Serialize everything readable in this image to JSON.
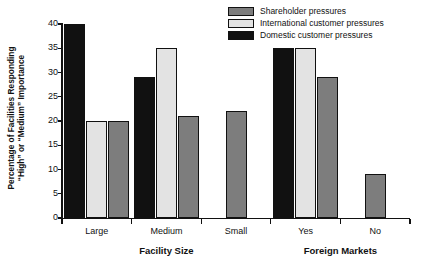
{
  "chart_data": {
    "type": "bar",
    "title": "",
    "xlabel": "",
    "ylabel": "Percentage of Facilities Responding \"High\" or \"Medium\" Importance",
    "ylabel_line1": "Percentage of Facilities Responding",
    "ylabel_line2": "“High” or “Medium” Importance",
    "ylim": [
      0,
      40
    ],
    "ytick_labels": [
      "40",
      "35",
      "30",
      "25",
      "20",
      "15",
      "10",
      "5",
      "0"
    ],
    "ytick_values": [
      40,
      35,
      30,
      25,
      20,
      15,
      10,
      5,
      0
    ],
    "grid": false,
    "legend_position": "top-right",
    "categories": [
      "Large",
      "Medium",
      "Small",
      "Yes",
      "No"
    ],
    "group_axis_titles": [
      {
        "label": "Facility Size",
        "categories": [
          "Large",
          "Medium",
          "Small"
        ]
      },
      {
        "label": "Foreign Markets",
        "categories": [
          "Yes",
          "No"
        ]
      }
    ],
    "series": [
      {
        "name": "Domestic customer pressures",
        "color": "#111111",
        "values": [
          40,
          29,
          null,
          35,
          null
        ]
      },
      {
        "name": "International customer pressures",
        "color": "#e3e3e3",
        "values": [
          20,
          35,
          null,
          35,
          null
        ]
      },
      {
        "name": "Shareholder pressures",
        "color": "#7d7d7d",
        "values": [
          20,
          21,
          22,
          29,
          9
        ]
      }
    ],
    "legend_entries": [
      {
        "label": "Shareholder pressures",
        "color": "#7d7d7d"
      },
      {
        "label": "International customer pressures",
        "color": "#e3e3e3"
      },
      {
        "label": "Domestic customer pressures",
        "color": "#111111"
      }
    ],
    "bars": [
      {
        "category": "Large",
        "series": "Domestic customer pressures",
        "value": 40
      },
      {
        "category": "Large",
        "series": "International customer pressures",
        "value": 20
      },
      {
        "category": "Large",
        "series": "Shareholder pressures",
        "value": 20
      },
      {
        "category": "Medium",
        "series": "Domestic customer pressures",
        "value": 29
      },
      {
        "category": "Medium",
        "series": "International customer pressures",
        "value": 35
      },
      {
        "category": "Medium",
        "series": "Shareholder pressures",
        "value": 21
      },
      {
        "category": "Small",
        "series": "Shareholder pressures",
        "value": 22
      },
      {
        "category": "Yes",
        "series": "Domestic customer pressures",
        "value": 35
      },
      {
        "category": "Yes",
        "series": "International customer pressures",
        "value": 35
      },
      {
        "category": "Yes",
        "series": "Shareholder pressures",
        "value": 29
      },
      {
        "category": "No",
        "series": "Shareholder pressures",
        "value": 9
      }
    ]
  }
}
